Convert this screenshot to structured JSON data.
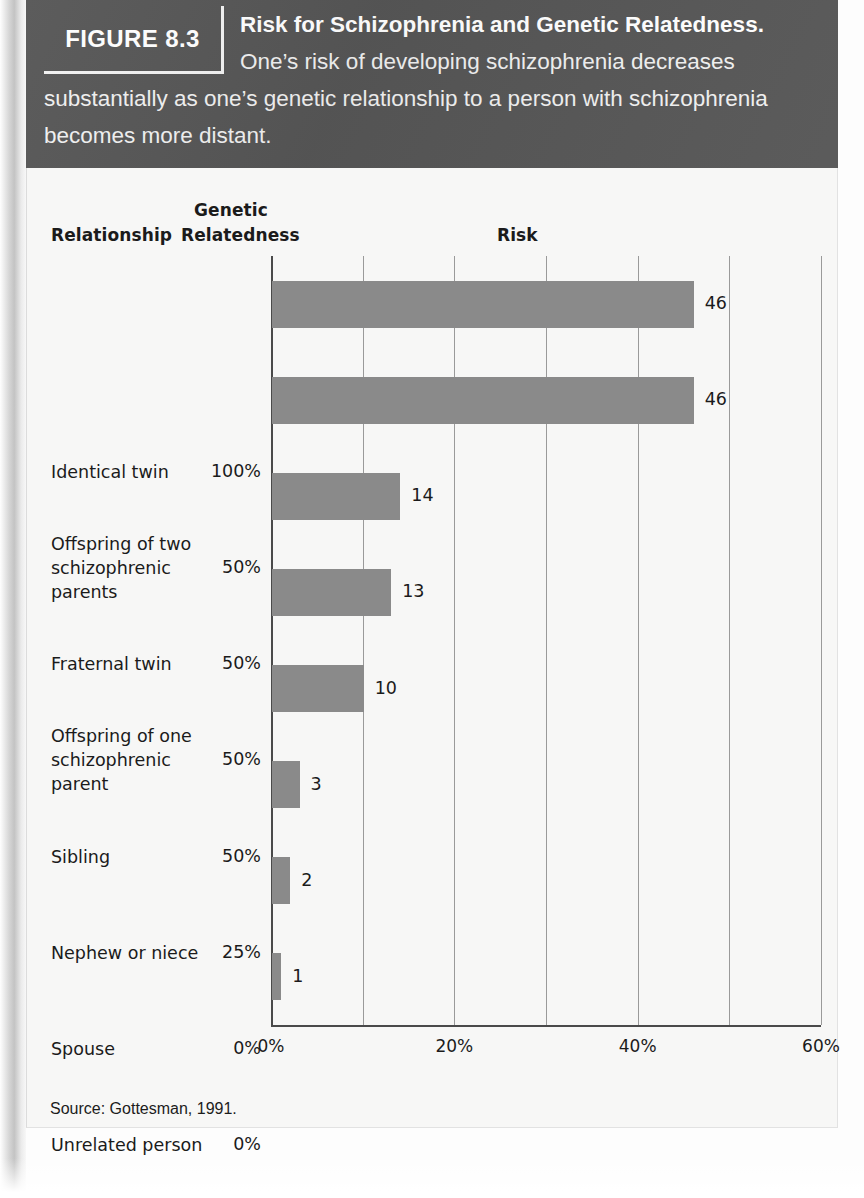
{
  "figure": {
    "tag": "FIGURE 8.3",
    "caption_bold": "Risk for Schizophrenia and Genetic Relatedness.",
    "caption_rest": " One’s risk of developing schizophrenia decreases substantially as one’s genetic relationship to a person with schizophrenia becomes more distant.",
    "source": "Source: Gottesman, 1991."
  },
  "headers": {
    "relationship": "Relationship",
    "genetic_line1": "Genetic",
    "genetic_line2": "Relatedness",
    "risk": "Risk"
  },
  "colors": {
    "banner": "#565656",
    "bar": "#8a8a8a",
    "card": "#f7f7f6",
    "gridline": "#9a9a9a",
    "axis": "#4a4a4a",
    "text": "#1b1b1b"
  },
  "chart_data": {
    "type": "bar",
    "orientation": "horizontal",
    "title": "Risk for Schizophrenia and Genetic Relatedness",
    "xlabel": "Risk",
    "ylabel": "Relationship",
    "xlim": [
      0,
      60
    ],
    "xticks": [
      0,
      20,
      40,
      60
    ],
    "xtick_labels": [
      "0%",
      "20%",
      "40%",
      "60%"
    ],
    "gridlines": [
      0,
      10,
      20,
      30,
      40,
      50,
      60
    ],
    "grid": true,
    "legend": "none",
    "value_suffix": "",
    "categories": [
      "Identical twin",
      "Offspring of two schizophrenic parents",
      "Fraternal twin",
      "Offspring of one schizophrenic parent",
      "Sibling",
      "Nephew or niece",
      "Spouse",
      "Unrelated person"
    ],
    "values": [
      46,
      46,
      14,
      13,
      10,
      3,
      2,
      1
    ],
    "genetic_relatedness": [
      "100%",
      "50%",
      "50%",
      "50%",
      "50%",
      "25%",
      "0%",
      "0%"
    ],
    "rows": [
      {
        "label_lines": [
          "Identical twin"
        ],
        "relatedness": "100%",
        "value": 46,
        "value_label": "46"
      },
      {
        "label_lines": [
          "Offspring of two",
          "schizophrenic",
          "parents"
        ],
        "relatedness": "50%",
        "value": 46,
        "value_label": "46"
      },
      {
        "label_lines": [
          "Fraternal twin"
        ],
        "relatedness": "50%",
        "value": 14,
        "value_label": "14"
      },
      {
        "label_lines": [
          "Offspring of one",
          "schizophrenic",
          "parent"
        ],
        "relatedness": "50%",
        "value": 13,
        "value_label": "13"
      },
      {
        "label_lines": [
          "Sibling"
        ],
        "relatedness": "50%",
        "value": 10,
        "value_label": "10"
      },
      {
        "label_lines": [
          "Nephew or niece"
        ],
        "relatedness": "25%",
        "value": 3,
        "value_label": "3"
      },
      {
        "label_lines": [
          "Spouse"
        ],
        "relatedness": "0%",
        "value": 2,
        "value_label": "2"
      },
      {
        "label_lines": [
          "Unrelated person"
        ],
        "relatedness": "0%",
        "value": 1,
        "value_label": "1"
      }
    ]
  }
}
